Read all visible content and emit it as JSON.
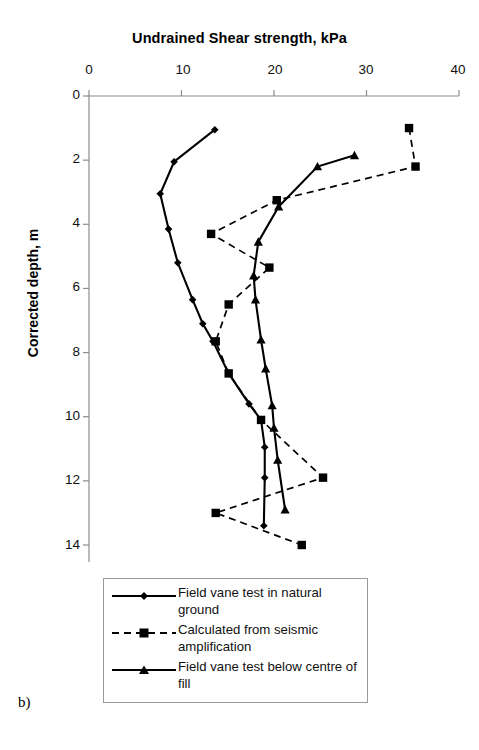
{
  "figure": {
    "panel_label": "b)",
    "title": "Undrained Shear strength, kPa",
    "ylabel": "Corrected depth, m"
  },
  "axes": {
    "x_ticks": [
      "0",
      "10",
      "20",
      "30",
      "40"
    ],
    "y_ticks": [
      "0",
      "2",
      "4",
      "6",
      "8",
      "10",
      "12",
      "14"
    ]
  },
  "legend": {
    "items": [
      {
        "label": "Field vane test in natural ground",
        "marker": "diamond",
        "line": "solid"
      },
      {
        "label": "Calculated from seismic amplification",
        "marker": "square",
        "line": "dashed"
      },
      {
        "label": "Field vane test below centre of fill",
        "marker": "triangle",
        "line": "solid"
      }
    ]
  },
  "chart_data": {
    "type": "line",
    "title": "Undrained Shear strength, kPa",
    "xlabel": "Undrained Shear strength, kPa",
    "ylabel": "Corrected depth, m",
    "xlim": [
      0,
      40
    ],
    "ylim": [
      0,
      14
    ],
    "y_inverted": true,
    "grid": false,
    "legend_position": "bottom",
    "x_tick_values": [
      0,
      10,
      20,
      30,
      40
    ],
    "y_tick_values": [
      0,
      2,
      4,
      6,
      8,
      10,
      12,
      14
    ],
    "series": [
      {
        "name": "Field vane test in natural ground",
        "marker": "diamond",
        "line": "solid",
        "color": "#000000",
        "points": [
          {
            "x": 13.6,
            "y": 1.05
          },
          {
            "x": 9.2,
            "y": 2.05
          },
          {
            "x": 7.7,
            "y": 3.05
          },
          {
            "x": 8.6,
            "y": 4.15
          },
          {
            "x": 9.6,
            "y": 5.2
          },
          {
            "x": 11.2,
            "y": 6.35
          },
          {
            "x": 12.3,
            "y": 7.1
          },
          {
            "x": 13.4,
            "y": 7.65
          },
          {
            "x": 15.1,
            "y": 8.65
          },
          {
            "x": 17.3,
            "y": 9.6
          },
          {
            "x": 18.6,
            "y": 10.1
          },
          {
            "x": 19.0,
            "y": 10.95
          },
          {
            "x": 19.0,
            "y": 11.9
          },
          {
            "x": 18.9,
            "y": 13.4
          }
        ]
      },
      {
        "name": "Calculated from seismic amplification",
        "marker": "square",
        "line": "dashed",
        "color": "#000000",
        "points": [
          {
            "x": 34.6,
            "y": 1.0
          },
          {
            "x": 35.3,
            "y": 2.2
          },
          {
            "x": 20.3,
            "y": 3.25
          },
          {
            "x": 13.2,
            "y": 4.3
          },
          {
            "x": 19.5,
            "y": 5.35
          },
          {
            "x": 15.1,
            "y": 6.5
          },
          {
            "x": 13.7,
            "y": 7.65
          },
          {
            "x": 15.1,
            "y": 8.65
          },
          {
            "x": 18.6,
            "y": 10.1
          },
          {
            "x": 25.3,
            "y": 11.9
          },
          {
            "x": 13.7,
            "y": 13.0
          },
          {
            "x": 23.0,
            "y": 14.0
          }
        ]
      },
      {
        "name": "Field vane test below centre of fill",
        "marker": "triangle",
        "line": "solid",
        "color": "#000000",
        "points": [
          {
            "x": 28.7,
            "y": 1.85
          },
          {
            "x": 24.7,
            "y": 2.2
          },
          {
            "x": 20.5,
            "y": 3.45
          },
          {
            "x": 18.3,
            "y": 4.55
          },
          {
            "x": 17.8,
            "y": 5.6
          },
          {
            "x": 18.0,
            "y": 6.35
          },
          {
            "x": 18.6,
            "y": 7.6
          },
          {
            "x": 19.1,
            "y": 8.5
          },
          {
            "x": 19.8,
            "y": 9.65
          },
          {
            "x": 20.0,
            "y": 10.35
          },
          {
            "x": 20.4,
            "y": 11.35
          },
          {
            "x": 21.2,
            "y": 12.9
          }
        ]
      }
    ]
  }
}
